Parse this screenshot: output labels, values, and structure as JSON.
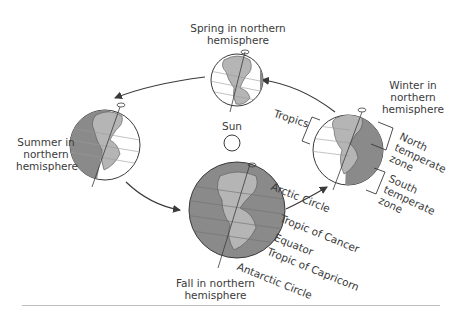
{
  "diagram": {
    "colors": {
      "ocean_dark": "#8a8a8a",
      "ocean_light": "#ffffff",
      "land": "#b5b5b5",
      "outline": "#3a3a3a",
      "text": "#3a3a3a",
      "rule": "#bdbdbd"
    },
    "sun": {
      "label": "Sun"
    },
    "seasons": {
      "spring": {
        "line1": "Spring in northern",
        "line2": "hemisphere"
      },
      "summer": {
        "line1": "Summer in",
        "line2": "northern",
        "line3": "hemisphere"
      },
      "fall": {
        "line1": "Fall in northern",
        "line2": "hemisphere"
      },
      "winter": {
        "line1": "Winter in",
        "line2": "northern",
        "line3": "hemisphere"
      }
    },
    "zones": {
      "tropics": "Tropics",
      "north_temperate": {
        "line1": "North",
        "line2": "temperate",
        "line3": "zone"
      },
      "south_temperate": {
        "line1": "South",
        "line2": "temperate",
        "line3": "zone"
      }
    },
    "latitude_lines": {
      "arctic_circle": "Arctic Circle",
      "tropic_of_cancer": "Tropic of Cancer",
      "equator": "Equator",
      "tropic_of_capricorn": "Tropic of Capricorn",
      "antarctic_circle": "Antarctic Circle"
    }
  }
}
